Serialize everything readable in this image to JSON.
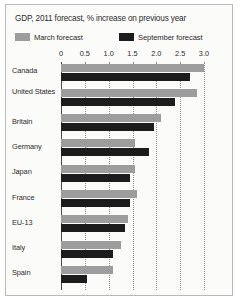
{
  "chart": {
    "title": "GDP, 2011 forecast, % increase on previous year",
    "legend": [
      {
        "label": "March forecast",
        "color": "#9d9d9d",
        "key": "march"
      },
      {
        "label": "September forecast",
        "color": "#1c1c1c",
        "key": "september"
      }
    ]
  },
  "chart_data": {
    "type": "bar",
    "orientation": "horizontal",
    "title": "GDP, 2011 forecast, % increase on previous year",
    "xlabel": "",
    "ylabel": "",
    "xlim": [
      0,
      3.0
    ],
    "xticks": [
      "0",
      "0.5",
      "1.0",
      "1.5",
      "2.0",
      "2.5",
      "3.0"
    ],
    "xtick_values": [
      0,
      0.5,
      1.0,
      1.5,
      2.0,
      2.5,
      3.0
    ],
    "grid": true,
    "grid_axis": "x",
    "legend_position": "top-left",
    "categories": [
      "Canada",
      "United States",
      "Britain",
      "Germany",
      "Japan",
      "France",
      "EU-13",
      "Italy",
      "Spain"
    ],
    "series": [
      {
        "name": "March forecast",
        "color": "#9d9d9d",
        "values": [
          3.0,
          2.85,
          2.1,
          1.55,
          1.55,
          1.6,
          1.4,
          1.25,
          1.1
        ]
      },
      {
        "name": "September forecast",
        "color": "#1c1c1c",
        "values": [
          2.7,
          2.4,
          1.95,
          1.85,
          1.45,
          1.45,
          1.35,
          1.1,
          0.55
        ]
      }
    ]
  }
}
